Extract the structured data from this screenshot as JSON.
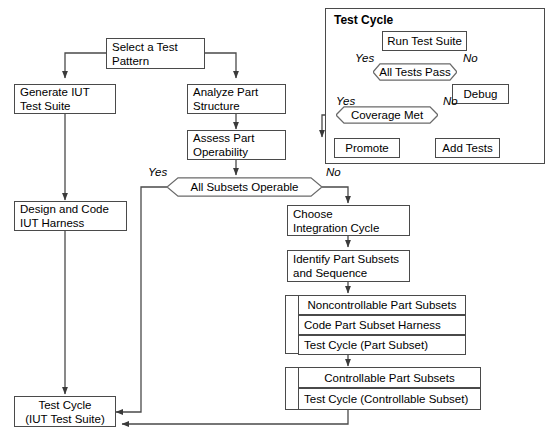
{
  "diagram": {
    "colors": {
      "line": "#4a4a4a",
      "text": "#000000",
      "background": "#ffffff"
    }
  },
  "main_flow": {
    "select_test_pattern": {
      "line1": "Select a Test",
      "line2": "Pattern"
    },
    "generate_iut_test_suite": {
      "line1": "Generate IUT",
      "line2": "Test Suite"
    },
    "analyze_part_structure": {
      "line1": "Analyze Part",
      "line2": "Structure"
    },
    "assess_part_operability": {
      "line1": "Assess Part",
      "line2": "Operability"
    },
    "all_subsets_operable": {
      "label": "All Subsets Operable",
      "yes": "Yes",
      "no": "No"
    },
    "design_and_code_iut_harness": {
      "line1": "Design and Code",
      "line2": "IUT Harness"
    },
    "choose_integration_cycle": {
      "line1": "Choose",
      "line2": "Integration Cycle"
    },
    "identify_part_subsets": {
      "line1": "Identify Part Subsets",
      "line2": "and Sequence"
    },
    "noncontrollable_group": {
      "title": "Noncontrollable Part Subsets",
      "items": [
        "Code Part Subset Harness",
        "Test Cycle (Part Subset)"
      ]
    },
    "controllable_group": {
      "title": "Controllable Part Subsets",
      "items": [
        "Test Cycle (Controllable Subset)"
      ]
    },
    "test_cycle_iut": {
      "line1": "Test Cycle",
      "line2": "(IUT Test Suite)"
    }
  },
  "test_cycle_frame": {
    "label": "Test Cycle",
    "run_test_suite": "Run Test Suite",
    "all_tests_pass": {
      "label": "All Tests Pass",
      "yes": "Yes",
      "no": "No"
    },
    "debug": "Debug",
    "coverage_met": {
      "label": "Coverage Met",
      "yes": "Yes",
      "no": "No"
    },
    "promote": "Promote",
    "add_tests": "Add Tests"
  }
}
